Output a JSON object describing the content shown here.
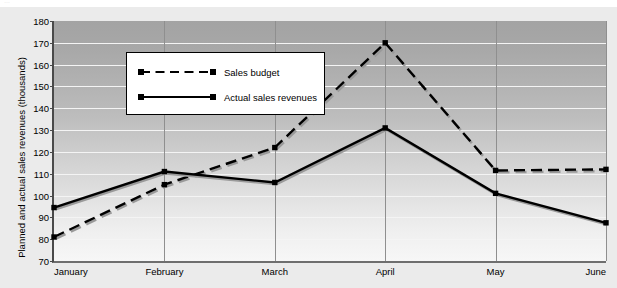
{
  "top_fragment": "…",
  "chart_data": {
    "type": "line",
    "title": "",
    "xlabel": "",
    "ylabel": "Planned and actual sales revenues (thousands)",
    "categories": [
      "January",
      "February",
      "March",
      "April",
      "May",
      "June"
    ],
    "ylim": [
      70,
      180
    ],
    "yticks": [
      70,
      80,
      90,
      100,
      110,
      120,
      130,
      140,
      150,
      160,
      170,
      180
    ],
    "grid": true,
    "legend_position": "upper-left-inside",
    "series": [
      {
        "name": "Sales budget",
        "style": "dashed",
        "marker": "square",
        "color": "#000000",
        "values": [
          81,
          105,
          122,
          170,
          111.5,
          112
        ]
      },
      {
        "name": "Actual sales revenues",
        "style": "solid",
        "marker": "square",
        "color": "#000000",
        "values": [
          94.5,
          111,
          106,
          131,
          101,
          87.5
        ]
      }
    ]
  },
  "legend": {
    "items": [
      {
        "label": "Sales budget"
      },
      {
        "label": "Actual sales revenues"
      }
    ]
  }
}
